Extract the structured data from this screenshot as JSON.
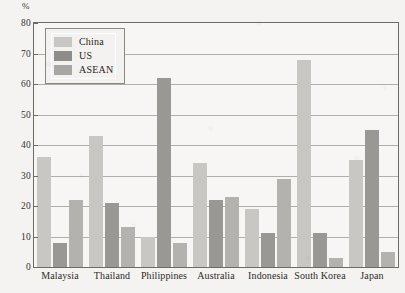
{
  "chart_data": {
    "type": "bar",
    "title": "",
    "subtitle": "",
    "xlabel": "",
    "ylabel": "%",
    "unit_label": "%",
    "ylim": [
      0,
      80
    ],
    "y_ticks": [
      0,
      10,
      20,
      30,
      40,
      50,
      60,
      70,
      80
    ],
    "y_tick_labels": [
      "0",
      "10",
      "20",
      "30",
      "40",
      "50",
      "60",
      "70",
      "80"
    ],
    "grid": true,
    "grid_axis": "y",
    "legend_position": "top-left",
    "categories": [
      "Malaysia",
      "Thailand",
      "Philippines",
      "Australia",
      "Indonesia",
      "South Korea",
      "Japan"
    ],
    "series": [
      {
        "name": "China",
        "color": "#c9c7c3",
        "values": [
          36,
          43,
          10,
          34,
          19,
          68,
          35
        ]
      },
      {
        "name": "US",
        "color": "#9a9894",
        "values": [
          8,
          21,
          62,
          22,
          11,
          11,
          45
        ]
      },
      {
        "name": "ASEAN",
        "color": "#b4b2ae",
        "values": [
          22,
          13,
          8,
          23,
          29,
          3,
          5
        ]
      }
    ]
  },
  "legend": {
    "items": [
      {
        "label": "China",
        "swatch": "china"
      },
      {
        "label": "US",
        "swatch": "us"
      },
      {
        "label": "ASEAN",
        "swatch": "asean"
      }
    ]
  },
  "colors": {
    "china": "#c9c7c3",
    "us": "#9a9894",
    "asean": "#b4b2ae",
    "axis": "#6e6a64",
    "grid": "#b2aea8",
    "plot_background": "#f7f6f4",
    "page_background": "#f4f3f1",
    "text": "#2f2b27"
  }
}
